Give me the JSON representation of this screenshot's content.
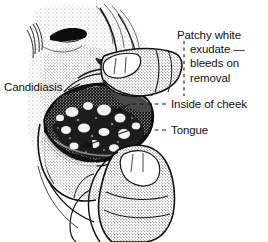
{
  "figure": {
    "background_color": "#ffffff",
    "ink_color": "#111111",
    "illustration": "pen-and-ink stippled medical drawing of a human head in profile with two fingers retracting the lower cheek and lip to expose the inside of the mouth showing patchy white exudate on the tongue and buccal mucosa"
  },
  "labels": {
    "candidiasis": "Candidiasis",
    "exudate_line1": "Patchy white",
    "exudate_line2": "exudate —",
    "exudate_line3": "bleeds on",
    "exudate_line4": "removal",
    "inside_of_cheek": "Inside of cheek",
    "tongue": "Tongue"
  },
  "leaders": {
    "exudate_style": "vertical-dashed",
    "inside_of_cheek_style": "horizontal-dashed-with-arrowhead",
    "tongue_style": "horizontal-dashed-with-arrowhead",
    "candidiasis_style": "none"
  }
}
